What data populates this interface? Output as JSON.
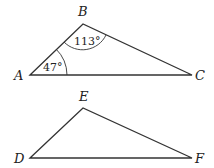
{
  "triangles": [
    {
      "name": "ABC",
      "vertices": {
        "A": {
          "label": "A",
          "x": 30,
          "y": 75
        },
        "B": {
          "label": "B",
          "x": 83,
          "y": 24
        },
        "C": {
          "label": "C",
          "x": 192,
          "y": 75
        }
      },
      "angles": {
        "A": "47°",
        "B": "113°"
      }
    },
    {
      "name": "DEF",
      "vertices": {
        "D": {
          "label": "D",
          "x": 30,
          "y": 158
        },
        "E": {
          "label": "E",
          "x": 83,
          "y": 108
        },
        "F": {
          "label": "F",
          "x": 192,
          "y": 158
        }
      }
    }
  ]
}
